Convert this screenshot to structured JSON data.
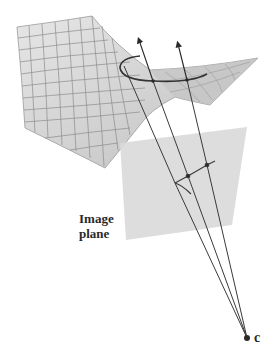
{
  "diagram": {
    "labels": {
      "image_plane_line1": "Image",
      "image_plane_line2": "plane",
      "camera_center": "c"
    },
    "colors": {
      "surface_fill": "#d4d4d4",
      "surface_grid": "#8a8a8a",
      "plane_fill": "#dcdcdc",
      "line": "#3a3a3a",
      "background": "#ffffff"
    },
    "elements": [
      "saddle-surface",
      "contour-curve-on-surface",
      "image-plane",
      "projected-curve",
      "viewing-rays",
      "surface-normal-arrows",
      "camera-center"
    ]
  }
}
